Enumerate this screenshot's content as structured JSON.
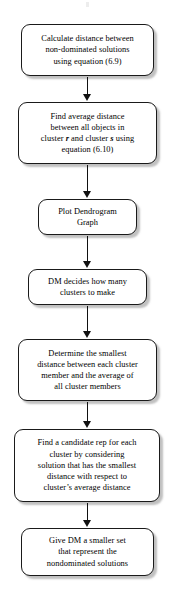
{
  "diagram": {
    "orientation": "vertical",
    "node_shape": "rounded-rectangle",
    "colors": {
      "background": "#ffffff",
      "node_fill": "#ffffff",
      "node_border": "#1a1a1a",
      "node_shadow": "#8c8c8c",
      "connector": "#111111",
      "text": "#000000"
    },
    "nodes": [
      {
        "id": "node-1",
        "name": "calculate-distance",
        "text": "Calculate distance between\nnon-dominated solutions\nusing equation (6.9)"
      },
      {
        "id": "node-2",
        "name": "find-average-distance",
        "text_pre": "Find average distance\nbetween all objects in\ncluster ",
        "emphasis_1": "r",
        "text_mid": " and cluster ",
        "emphasis_2": "s",
        "text_post": " using\nequation (6.10)"
      },
      {
        "id": "node-3",
        "name": "plot-dendrogram-graph",
        "text": "Plot Dendrogram\nGraph"
      },
      {
        "id": "node-4",
        "name": "dm-decides-clusters",
        "text": "DM decides how many\nclusters to make"
      },
      {
        "id": "node-5",
        "name": "determine-smallest-distance",
        "text": "Determine the smallest\ndistance between each cluster\nmember and the average of\nall cluster members"
      },
      {
        "id": "node-6",
        "name": "find-candidate-rep",
        "text": "Find a candidate rep for each\ncluster by considering\nsolution that has the smallest\ndistance with respect to\ncluster’s average distance"
      },
      {
        "id": "node-7",
        "name": "give-dm-smaller-set",
        "text": "Give DM a smaller set\nthat represent the\nnondominated solutions"
      }
    ],
    "connectors": [
      {
        "id": "arrow-1",
        "name": "connector-1-to-2",
        "from": "node-1",
        "to": "node-2"
      },
      {
        "id": "arrow-2",
        "name": "connector-2-to-3",
        "from": "node-2",
        "to": "node-3"
      },
      {
        "id": "arrow-3",
        "name": "connector-3-to-4",
        "from": "node-3",
        "to": "node-4"
      },
      {
        "id": "arrow-4",
        "name": "connector-4-to-5",
        "from": "node-4",
        "to": "node-5"
      },
      {
        "id": "arrow-5",
        "name": "connector-5-to-6",
        "from": "node-5",
        "to": "node-6"
      },
      {
        "id": "arrow-6",
        "name": "connector-6-to-7",
        "from": "node-6",
        "to": "node-7"
      }
    ]
  }
}
